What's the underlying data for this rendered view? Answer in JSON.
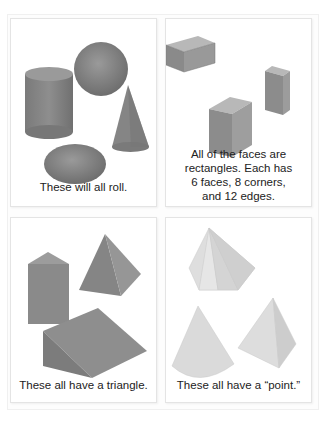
{
  "cards": [
    {
      "id": "roll",
      "caption": "These will all roll.",
      "shapes": [
        "cylinder",
        "sphere",
        "cone",
        "ellipsoid"
      ],
      "color": "#8a8a8a"
    },
    {
      "id": "rectangular-prisms",
      "caption": "All of the faces are rectangles. Each has 6 faces, 8 corners, and 12 edges.",
      "caption_lines": [
        "All of the faces are",
        "rectangles. Each has",
        "6 faces, 8 corners,",
        "and 12 edges."
      ],
      "shapes": [
        "rectangular-prism",
        "rectangular-prism",
        "rectangular-prism"
      ],
      "color": "#8e8e8e"
    },
    {
      "id": "triangle",
      "caption": "These all have a triangle.",
      "shapes": [
        "triangular-prism",
        "square-pyramid",
        "wedge"
      ],
      "color": "#8a8a8a"
    },
    {
      "id": "point",
      "caption": "These all have a “point.”",
      "shapes": [
        "hexagonal-pyramid",
        "cone",
        "triangular-pyramid"
      ],
      "color": "#d8d8d8"
    }
  ]
}
